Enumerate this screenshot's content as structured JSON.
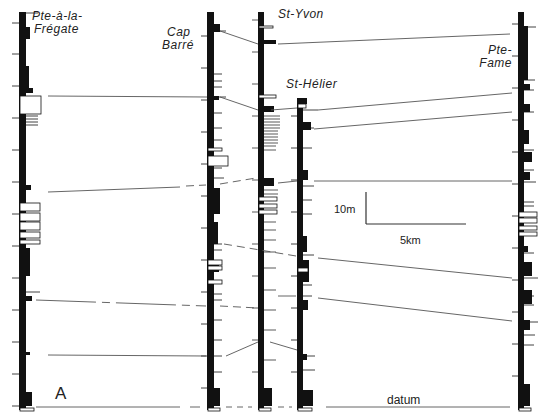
{
  "figure": {
    "panel_label": "A",
    "datum_label": "datum",
    "scale_bar": {
      "vertical": "10m",
      "horizontal": "5km"
    },
    "sections": [
      {
        "name_line1": "Pte-à-la-",
        "name_line2": "Frégate",
        "x": 18
      },
      {
        "name_line1": "Cap",
        "name_line2": "Barré",
        "x": 208
      },
      {
        "name_line1": "St-Yvon",
        "name_line2": "",
        "x": 260
      },
      {
        "name_line1": "St-Hélier",
        "name_line2": "",
        "x": 298
      },
      {
        "name_line1": "Pte-",
        "name_line2": "Fame",
        "x": 518
      }
    ],
    "correlation_lines": 8,
    "colors": {
      "ink": "#111111",
      "line": "#555555",
      "paper": "#ffffff"
    }
  }
}
